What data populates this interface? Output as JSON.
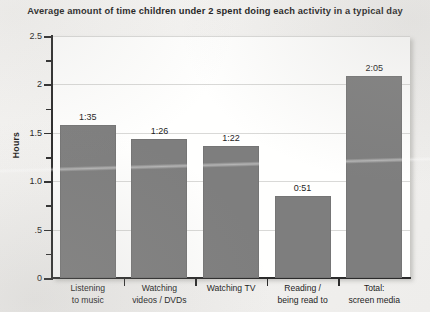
{
  "chart_data": {
    "type": "bar",
    "title": "Average amount of time children under 2 spent doing each activity in a typical day",
    "xlabel": "",
    "ylabel": "Hours",
    "ylim": [
      0,
      2.5
    ],
    "grid": true,
    "legend": "none",
    "categories": [
      "Listening to music",
      "Watching videos / DVDs",
      "Watching TV",
      "Reading / being read to",
      "Total: screen media"
    ],
    "category_lines": [
      [
        "Listening",
        "to music"
      ],
      [
        "Watching",
        "videos / DVDs"
      ],
      [
        "Watching TV",
        ""
      ],
      [
        "Reading /",
        "being read to"
      ],
      [
        "Total:",
        "screen media"
      ]
    ],
    "data_labels": [
      "1:35",
      "1:26",
      "1:22",
      "0:51",
      "2:05"
    ],
    "values": [
      1.583,
      1.433,
      1.367,
      0.85,
      2.083
    ],
    "ytick_labels": [
      "0",
      ".5",
      "1.0",
      "1.5",
      "2",
      "2.5"
    ],
    "ytick_values": [
      0,
      0.5,
      1.0,
      1.5,
      2.0,
      2.5
    ],
    "yminor_values": [
      0.25,
      0.75,
      1.25,
      1.75,
      2.25
    ],
    "bar_color": "#7e7e7e",
    "axis_color": "#2b2b2b",
    "grid_color": "#d9d9d7",
    "plot_background": "#ffffff",
    "page_background": "#f4f3f1"
  }
}
